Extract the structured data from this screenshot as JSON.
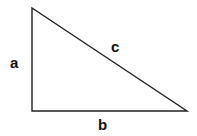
{
  "diagram": {
    "type": "right-triangle",
    "vertices": {
      "top": [
        32,
        8
      ],
      "right_angle": [
        32,
        111
      ],
      "right": [
        187,
        111
      ]
    },
    "sides": [
      {
        "id": "a",
        "label": "a",
        "position": "left vertical leg"
      },
      {
        "id": "b",
        "label": "b",
        "position": "bottom horizontal leg"
      },
      {
        "id": "c",
        "label": "c",
        "position": "hypotenuse"
      }
    ],
    "stroke_color": "#222222",
    "background": "#ffffff"
  }
}
